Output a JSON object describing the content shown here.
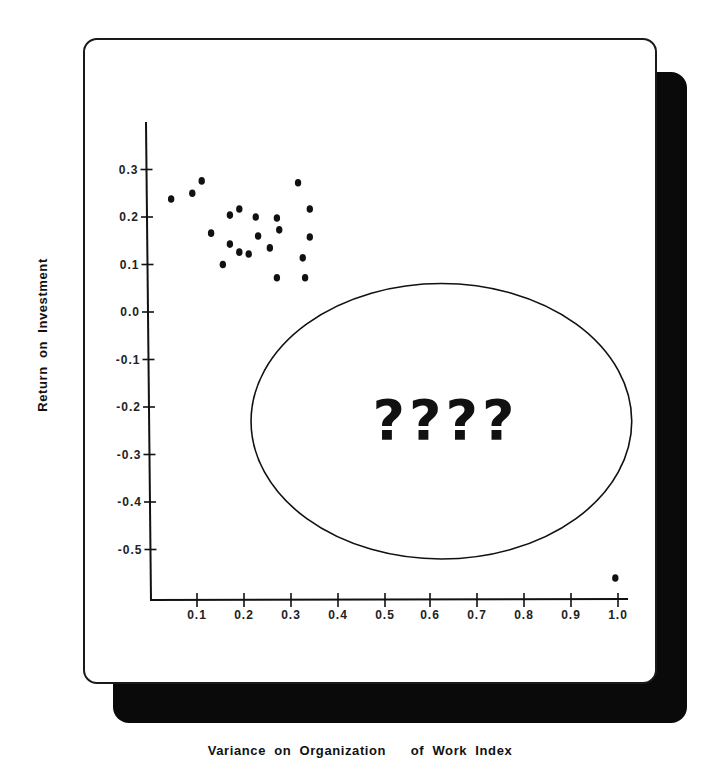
{
  "chart_data": {
    "type": "scatter",
    "title": "",
    "xlabel": "Variance on Organization   of Work Index",
    "ylabel": "Return on Investment",
    "xlim": [
      0.0,
      1.0
    ],
    "ylim": [
      -0.58,
      0.38
    ],
    "x_ticks": [
      0.1,
      0.2,
      0.3,
      0.4,
      0.5,
      0.6,
      0.7,
      0.8,
      0.9,
      1.0
    ],
    "x_tick_labels": [
      "0.1",
      "0.2",
      "0.3",
      "0.4",
      "0.5",
      "0.6",
      "0.7",
      "0.8",
      "0.9",
      "1.0"
    ],
    "y_ticks": [
      0.3,
      0.2,
      0.1,
      0.0,
      -0.1,
      -0.2,
      -0.3,
      -0.4,
      -0.5
    ],
    "y_tick_labels": [
      "0.3",
      "0.2",
      "0.1",
      "0.0",
      "-0.1",
      "-0.2",
      "-0.3",
      "-0.4",
      "-0.5"
    ],
    "grid": false,
    "legend": null,
    "series": [
      {
        "name": "observations",
        "points": [
          {
            "x": 0.045,
            "y": 0.238
          },
          {
            "x": 0.09,
            "y": 0.25
          },
          {
            "x": 0.11,
            "y": 0.276
          },
          {
            "x": 0.13,
            "y": 0.166
          },
          {
            "x": 0.155,
            "y": 0.1
          },
          {
            "x": 0.17,
            "y": 0.204
          },
          {
            "x": 0.17,
            "y": 0.143
          },
          {
            "x": 0.19,
            "y": 0.217
          },
          {
            "x": 0.19,
            "y": 0.126
          },
          {
            "x": 0.21,
            "y": 0.122
          },
          {
            "x": 0.225,
            "y": 0.2
          },
          {
            "x": 0.23,
            "y": 0.16
          },
          {
            "x": 0.255,
            "y": 0.135
          },
          {
            "x": 0.27,
            "y": 0.198
          },
          {
            "x": 0.275,
            "y": 0.173
          },
          {
            "x": 0.27,
            "y": 0.072
          },
          {
            "x": 0.315,
            "y": 0.272
          },
          {
            "x": 0.325,
            "y": 0.114
          },
          {
            "x": 0.33,
            "y": 0.072
          },
          {
            "x": 0.34,
            "y": 0.217
          },
          {
            "x": 0.34,
            "y": 0.158
          },
          {
            "x": 0.99,
            "y": -0.56
          }
        ]
      }
    ],
    "annotations": [
      {
        "type": "ellipse",
        "center_x": 0.62,
        "center_y": -0.23,
        "rx": 0.405,
        "ry": 0.29,
        "text": "????"
      }
    ]
  },
  "labels": {
    "ylabel": "Return on Investment",
    "xlabel": "Variance on Organization   of Work Index",
    "annotation": "????"
  }
}
